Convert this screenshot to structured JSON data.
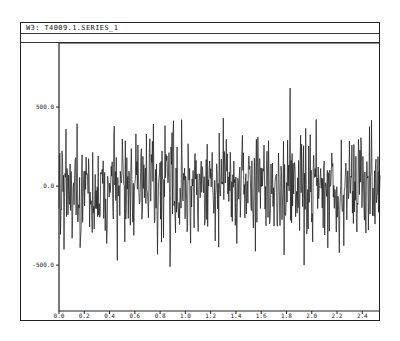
{
  "window": {
    "title": "W3: T4009.1.SERIES_1"
  },
  "chart_data": {
    "type": "line",
    "title": "W3: T4009.1.SERIES_1",
    "xlabel": "",
    "ylabel": "",
    "xlim": [
      0.0,
      2.54
    ],
    "ylim": [
      -790,
      905
    ],
    "x_ticks": [
      0.0,
      0.2,
      0.4,
      0.6,
      0.8,
      1.0,
      1.2,
      1.4,
      1.6,
      1.8,
      2.0,
      2.2,
      2.4
    ],
    "x_tick_labels": [
      "0.0",
      "0.2",
      "0.4",
      "0.6",
      "0.8",
      "1.0",
      "1.2",
      "1.4",
      "1.6",
      "1.8",
      "2.0",
      "2.2",
      "2.4"
    ],
    "y_ticks": [
      500.0,
      0.0,
      -500.0
    ],
    "y_tick_labels": [
      "500.0",
      "0.0",
      "-500.0"
    ],
    "grid": false,
    "legend": null,
    "series": [
      {
        "name": "SERIES_1",
        "description": "dense noise-like time series centered on 0, typical amplitude about ±300",
        "n_points": 640,
        "mean": 0,
        "std": 170,
        "max": 620,
        "min": -510,
        "notable_points": [
          {
            "x": 1.83,
            "y": 620
          },
          {
            "x": 0.88,
            "y": -510
          },
          {
            "x": 1.94,
            "y": -500
          },
          {
            "x": 0.46,
            "y": -470
          },
          {
            "x": 0.97,
            "y": 420
          },
          {
            "x": 1.3,
            "y": 430
          }
        ]
      }
    ]
  }
}
